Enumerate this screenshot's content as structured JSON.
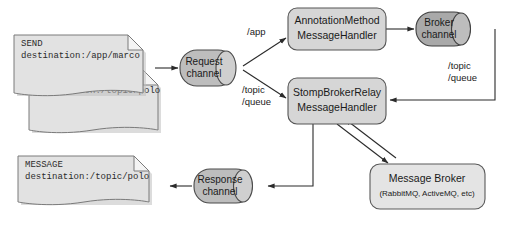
{
  "diagram": {
    "colors": {
      "box_fill": "#d6d6d6",
      "box_stroke": "#555555",
      "document_fill": "#e2e2e2",
      "document_stroke": "#7a7a7a",
      "channel_light_fill": "#bdbdbd",
      "channel_dark_fill": "#a9a9a9",
      "broker_fill": "#e4e4e4",
      "line_stroke": "#2b2b2b",
      "background": "#ffffff"
    },
    "documents": [
      {
        "id": "send-app-marco",
        "line1": "SEND",
        "line2": "destination:/app/marco"
      },
      {
        "id": "send-topic-polo",
        "line1": "SEND",
        "line2": "destination:/topic/polo"
      },
      {
        "id": "message-topic-polo",
        "line1": "MESSAGE",
        "line2": "destination:/topic/polo"
      }
    ],
    "channels": [
      {
        "id": "request-channel",
        "line1": "Request",
        "line2": "channel",
        "shade": "light"
      },
      {
        "id": "broker-channel",
        "line1": "Broker",
        "line2": "channel",
        "shade": "dark"
      },
      {
        "id": "response-channel",
        "line1": "Response",
        "line2": "channel",
        "shade": "light"
      }
    ],
    "handlers": [
      {
        "id": "annotation-method-message-handler",
        "line1": "AnnotationMethod",
        "line2": "MessageHandler"
      },
      {
        "id": "stomp-broker-relay-message-handler",
        "line1": "StompBrokerRelay",
        "line2": "MessageHandler"
      }
    ],
    "broker": {
      "id": "message-broker",
      "title": "Message Broker",
      "subtitle": "(RabbitMQ, ActiveMQ, etc)"
    },
    "edge_labels": [
      {
        "id": "label-app",
        "text": "/app"
      },
      {
        "id": "label-topic-queue-left-1",
        "text": "/topic"
      },
      {
        "id": "label-topic-queue-left-2",
        "text": "/queue"
      },
      {
        "id": "label-topic-queue-right-1",
        "text": "/topic"
      },
      {
        "id": "label-topic-queue-right-2",
        "text": "/queue"
      }
    ]
  }
}
